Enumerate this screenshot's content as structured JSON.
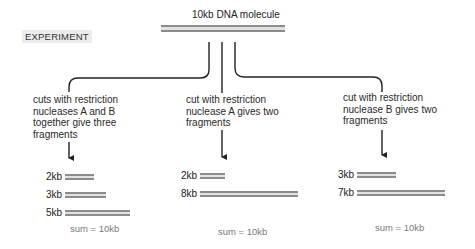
{
  "header": {
    "title": "10kb DNA molecule",
    "section_label": "EXPERIMENT"
  },
  "colors": {
    "dna_strand": "#8c8c8c",
    "line": "#222222",
    "sum_text": "#7a7a7a",
    "label_bg": "#ececec"
  },
  "branches": [
    {
      "description_lines": [
        "cuts with restriction",
        "nucleases A and B",
        "together give three",
        "fragments"
      ],
      "fragments": [
        {
          "label": "2kb",
          "size_kb": 2
        },
        {
          "label": "3kb",
          "size_kb": 3
        },
        {
          "label": "5kb",
          "size_kb": 5
        }
      ],
      "sum": "sum = 10kb"
    },
    {
      "description_lines": [
        "cut with restriction",
        "nuclease A gives two",
        "fragments"
      ],
      "fragments": [
        {
          "label": "2kb",
          "size_kb": 2
        },
        {
          "label": "8kb",
          "size_kb": 8
        }
      ],
      "sum": "sum = 10kb"
    },
    {
      "description_lines": [
        "cut with restriction",
        "nuclease B gives two",
        "fragments"
      ],
      "fragments": [
        {
          "label": "3kb",
          "size_kb": 3
        },
        {
          "label": "7kb",
          "size_kb": 7
        }
      ],
      "sum": "sum = 10kb"
    }
  ]
}
